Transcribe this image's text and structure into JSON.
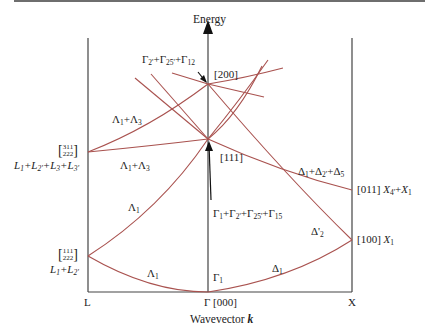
{
  "diagram": {
    "y_axis_label": "Energy",
    "x_axis_label": "Wavevector",
    "x_axis_symbol": "k",
    "x_ticks": [
      {
        "id": "L",
        "label": "L"
      },
      {
        "id": "Gamma",
        "label": "Γ [000]"
      },
      {
        "id": "X",
        "label": "X"
      }
    ],
    "point_labels": {
      "gamma200": "[200]",
      "gamma200_irreps": "Γ2'+Γ25'+Γ12",
      "gamma111": "[111]",
      "gamma111_irreps": "Γ1+Γ2'+Γ25'+Γ15",
      "gamma1": "Γ1",
      "L_upper_k": "[3/2 1/2 1/2]",
      "L_upper_irreps": "L1+L2'+L3+L3'",
      "L_lower_k": "[1/2 1/2 1/2]",
      "L_lower_irreps": "L1+L2'",
      "X_upper": "[011] X4'+X1",
      "X_lower": "[100] X1"
    },
    "branch_labels": {
      "lambda_upper": "Λ1+Λ3",
      "lambda_mid": "Λ1+Λ3",
      "lambda1_upper": "Λ1",
      "lambda1_lower": "Λ1",
      "delta_upper": "Δ1+Δ2'+Δ5",
      "delta2p": "Δ'2",
      "delta1": "Δ1"
    },
    "colors": {
      "curve": "#a9524f",
      "axis": "#444444",
      "text": "#222222"
    }
  }
}
